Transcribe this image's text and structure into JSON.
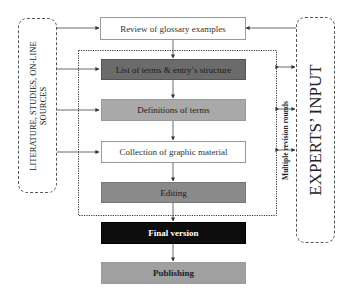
{
  "diagram": {
    "sources_box": {
      "label_line1": "LITERATURE, STUDIES, ON-LINE",
      "label_line2": "SOURCES"
    },
    "experts_box": {
      "label": "EXPERTS’ INPUT"
    },
    "revision_frame": {
      "label": "Multiple revision rounds"
    },
    "steps": [
      {
        "label": "Review of glossary examples",
        "fill": "#ffffff",
        "text_color": "#333333"
      },
      {
        "label": "List of terms & entry’s structure",
        "fill": "#6b6b6b",
        "text_color": "#1a1a1a"
      },
      {
        "label": "Definitions of terms",
        "fill": "#a9a9a9",
        "text_color": "#222222"
      },
      {
        "label": "Collection of graphic material",
        "fill": "#ffffff",
        "text_color": "#333333"
      },
      {
        "label": "Editing",
        "fill": "#8a8a8a",
        "text_color": "#1a1a1a"
      },
      {
        "label": "Final version",
        "fill": "#0d0d0d",
        "text_color": "#ffffff"
      },
      {
        "label": "Publishing",
        "fill": "#a0a0a0",
        "text_color": "#222222"
      }
    ]
  }
}
